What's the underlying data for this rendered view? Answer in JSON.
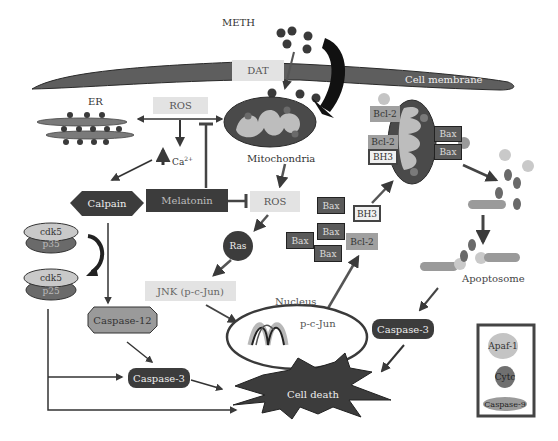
{
  "diagram": {
    "type": "signaling-pathway",
    "nodes": {
      "meth": "METH",
      "dat": "DAT",
      "cell_membrane": "Cell membrane",
      "er": "ER",
      "ros_top": "ROS",
      "calcium": "Ca",
      "calcium_sup": "2+",
      "mitochondria": "Mitochondria",
      "calpain": "Calpain",
      "melatonin": "Melatonin",
      "ros_mid": "ROS",
      "ras": "Ras",
      "cdk5_a": "cdk5",
      "p35": "p35",
      "cdk5_b": "cdk5",
      "p25": "p25",
      "jnk": "JNK (p-c-Jun)",
      "nucleus": "Nucleus",
      "pcjun": "p-c-Jun",
      "caspase12": "Caspase-12",
      "caspase3_left": "Caspase-3",
      "caspase3_right": "Caspase-3",
      "cell_death": "Cell death",
      "apoptosome": "Apoptosome",
      "bcl2_top": "Bcl-2",
      "bcl2_mid": "Bcl-2",
      "bh3_mito": "BH3",
      "bax_mito_1": "Bax",
      "bax_mito_2": "Bax",
      "bax_cyto_1": "Bax",
      "bax_cyto_2": "Bax",
      "bax_cyto_3": "Bax",
      "bax_cyto_4": "Bax",
      "bh3_cyto": "BH3",
      "bcl2_cyto": "Bcl-2"
    },
    "legend": {
      "items": [
        {
          "label": "Apaf-1",
          "shape": "circle",
          "color": "#c4c4c4"
        },
        {
          "label": "Cytc",
          "shape": "circle",
          "color": "#707070"
        },
        {
          "label": "Caspase-9",
          "shape": "ellipse",
          "color": "#9a9a9a"
        }
      ]
    },
    "edges": [
      {
        "from": "METH",
        "to": "DAT",
        "type": "activate"
      },
      {
        "from": "METH",
        "to": "Mitochondria",
        "type": "activate"
      },
      {
        "from": "ROS",
        "to": "ER",
        "type": "bidirectional"
      },
      {
        "from": "ROS",
        "to": "Mitochondria",
        "type": "bidirectional"
      },
      {
        "from": "ROS",
        "to": "Ca2+",
        "type": "activate"
      },
      {
        "from": "Melatonin",
        "to": "ROS",
        "type": "inhibit"
      },
      {
        "from": "Melatonin",
        "to": "ROS (mito)",
        "type": "inhibit"
      },
      {
        "from": "Ca2+",
        "to": "Calpain",
        "type": "activate"
      },
      {
        "from": "Mitochondria",
        "to": "ROS",
        "type": "activate"
      },
      {
        "from": "ROS",
        "to": "Ras",
        "type": "activate"
      },
      {
        "from": "Ras",
        "to": "JNK (p-c-Jun)",
        "type": "activate"
      },
      {
        "from": "JNK (p-c-Jun)",
        "to": "Nucleus",
        "type": "activate"
      },
      {
        "from": "Nucleus",
        "to": "Bcl-2/Bax",
        "type": "activate"
      },
      {
        "from": "BH3",
        "to": "Mitochondria",
        "type": "activate"
      },
      {
        "from": "Mitochondria",
        "to": "Apoptosome",
        "type": "activate"
      },
      {
        "from": "Apoptosome",
        "to": "Caspase-3",
        "type": "activate"
      },
      {
        "from": "Caspase-3",
        "to": "Cell death",
        "type": "activate"
      },
      {
        "from": "Calpain",
        "to": "Caspase-12",
        "type": "activate"
      },
      {
        "from": "cdk5/p35",
        "to": "cdk5/p25",
        "type": "convert"
      },
      {
        "from": "Caspase-12",
        "to": "Caspase-3",
        "type": "activate"
      },
      {
        "from": "cdk5/p25",
        "to": "Caspase-3",
        "type": "activate"
      },
      {
        "from": "cdk5/p25",
        "to": "Cell death",
        "type": "activate"
      },
      {
        "from": "Caspase-3",
        "to": "Cell death",
        "type": "activate"
      }
    ],
    "colors": {
      "membrane": "#5e5e5e",
      "dark_node": "#3c3c3c",
      "light_box": "#e3e3e3",
      "arrow": "#3a3a3a"
    }
  }
}
